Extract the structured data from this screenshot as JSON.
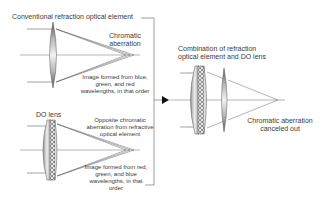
{
  "top_panel": {
    "title": "Conventional refraction optical element",
    "aberration_label": [
      "Chromatic",
      "aberration"
    ],
    "image_caption": [
      "Image formed from blue,",
      "green, and red",
      "wavelengths, in that order"
    ]
  },
  "bottom_panel": {
    "title": "DO lens",
    "aberration_label": [
      "Opposite chromatic",
      "aberration from refractive",
      "optical element"
    ],
    "image_caption": [
      "Image formed from red,",
      "green, and blue",
      "wavelengths, in that",
      "order"
    ]
  },
  "right_panel": {
    "title": [
      "Combination of refraction",
      "optical element and DO lens"
    ],
    "result_label": [
      "Chromatic aberration",
      "canceled out"
    ]
  },
  "icons": {
    "arrow": "right-pointing-triangle-arrow"
  },
  "colors": {
    "lines": "#555555",
    "lens_dark": "#6e6e6e",
    "lens_light": "#f0f0f0",
    "text": "#3a3a3a"
  }
}
